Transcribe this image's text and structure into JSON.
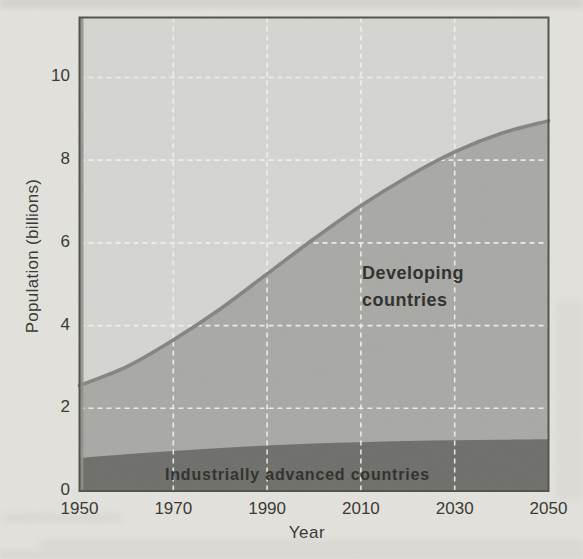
{
  "page": {
    "background_color": "#e4e2dd"
  },
  "chart_data": {
    "type": "area",
    "stacked": true,
    "title": "",
    "xlabel": "Year",
    "ylabel": "Population (billions)",
    "x": [
      1950,
      1960,
      1970,
      1980,
      1990,
      2000,
      2010,
      2020,
      2030,
      2040,
      2050
    ],
    "series": [
      {
        "name": "Industrially advanced countries",
        "values": [
          0.8,
          0.89,
          0.97,
          1.04,
          1.1,
          1.15,
          1.18,
          1.21,
          1.23,
          1.24,
          1.25
        ]
      },
      {
        "name": "Developing countries",
        "values": [
          1.75,
          2.11,
          2.68,
          3.36,
          4.15,
          4.95,
          5.72,
          6.39,
          6.97,
          7.41,
          7.7
        ]
      }
    ],
    "total_population": [
      2.55,
      3.0,
      3.65,
      4.4,
      5.25,
      6.1,
      6.9,
      7.6,
      8.2,
      8.65,
      8.95
    ],
    "xticks": [
      "1950",
      "1970",
      "1990",
      "2010",
      "2030",
      "2050"
    ],
    "xtick_values": [
      1950,
      1970,
      1990,
      2010,
      2030,
      2050
    ],
    "yticks": [
      "0",
      "2",
      "4",
      "6",
      "8",
      "10"
    ],
    "ytick_values": [
      0,
      2,
      4,
      6,
      8,
      10
    ],
    "xlim": [
      1950,
      2050
    ],
    "ylim": [
      0,
      11.45
    ],
    "grid": "white dashed gridlines over fills, vertical at interior x ticks, horizontal at y=2..10",
    "legend_position": "labels inside plot areas",
    "labels": {
      "developing": [
        "Developing",
        "countries"
      ],
      "advanced": "Industrially advanced countries"
    },
    "colors": {
      "page_background": "#e4e2dd",
      "plot_background": "#d5d5d1",
      "developing_fill": "#a8a8a5",
      "advanced_fill": "#6d6d69",
      "total_curve_stroke": "#83837f",
      "gridline": "#f4f4f0",
      "plot_border": "#50504b",
      "left_edge_stripe": "#8e8e89",
      "label_text": "#2d2d29",
      "tick_text": "#35352f"
    }
  }
}
